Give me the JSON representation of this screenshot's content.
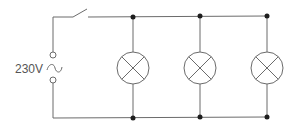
{
  "diagram": {
    "source": {
      "label": "230V",
      "symbol": "ac-tilde"
    },
    "switch": {
      "state": "open"
    },
    "lamps": [
      {
        "id": "lamp-1",
        "symbol": "lamp-cross"
      },
      {
        "id": "lamp-2",
        "symbol": "lamp-cross"
      },
      {
        "id": "lamp-3",
        "symbol": "lamp-cross"
      }
    ],
    "junctions_count": 6,
    "colors": {
      "wire": "#6b6b6b",
      "junction": "#1e1e1e",
      "text": "#555555",
      "background": "#ffffff"
    }
  }
}
